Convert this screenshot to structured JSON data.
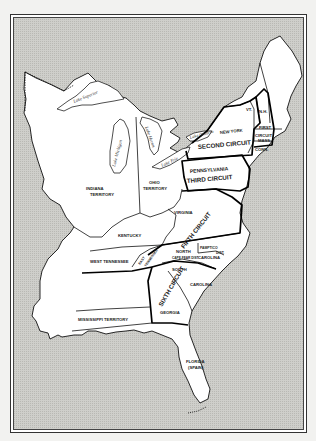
{
  "map": {
    "subject": "United States Federal Judicial Circuits",
    "colors": {
      "water": "#c8c8c4",
      "land": "#ffffff",
      "border": "#111111",
      "page": "#f2f2f0"
    },
    "lakes": {
      "superior": "Lake Superior",
      "michigan": "Lake Michigan",
      "huron": "Lake Huron",
      "erie": "Lake Erie",
      "ontario": "Lake Ontario"
    },
    "territories": {
      "indiana_1": "INDIANA",
      "indiana_2": "TERRITORY",
      "ohio_1": "OHIO",
      "ohio_2": "TERRITORY",
      "mississippi": "MISSISSIPPI TERRITORY",
      "florida_1": "FLORIDA",
      "florida_2": "(SPAIN)"
    },
    "states": {
      "new_york": "NEW YORK",
      "vermont": "VT.",
      "new_hampshire": "N.H.",
      "massachusetts": "MASS.",
      "connecticut": "CONN.",
      "pennsylvania": "PENNSYLVANIA",
      "virginia": "VIRGINIA",
      "kentucky": "KENTUCKY",
      "west_tennessee": "WEST TENNESSEE",
      "east_tennessee_1": "EAST",
      "east_tennessee_2": "TENNESSEE",
      "north_carolina_1": "NORTH",
      "north_carolina_2": "CAROLINA",
      "cape_fear": "CAPE FEAR DIST.",
      "pamptico_1": "PAMPTICO",
      "pamptico_2": "DIST.",
      "south_carolina_1": "SOUTH",
      "south_carolina_2": "CAROLINA",
      "georgia": "GEORGIA"
    },
    "circuits": {
      "first_1": "FIRST",
      "first_2": "CIRCUIT",
      "second": "SECOND CIRCUIT",
      "third": "THIRD CIRCUIT",
      "fifth": "FIFTH CIRCUIT",
      "sixth": "SIXTH CIRCUIT"
    }
  }
}
